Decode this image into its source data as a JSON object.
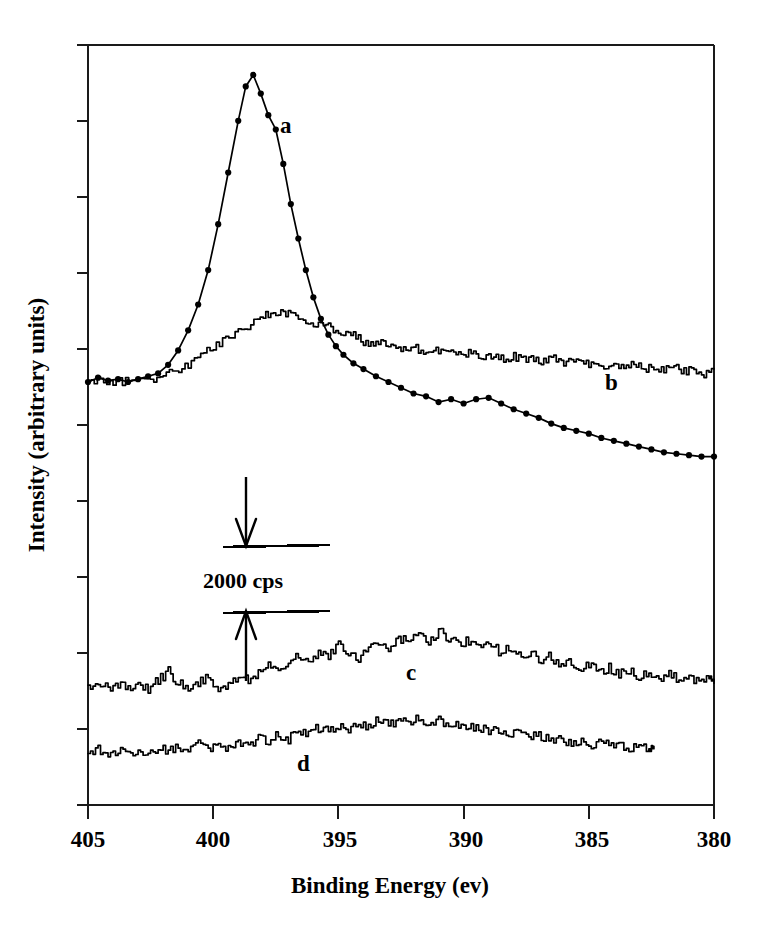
{
  "chart_data": {
    "type": "line",
    "title": "",
    "xlabel": "Binding Energy (ev)",
    "ylabel": "Intensity (arbitrary units)",
    "xlim": [
      405,
      380
    ],
    "x_axis_reversed": true,
    "xticks": [
      405,
      400,
      395,
      390,
      385,
      380
    ],
    "xticklabels": [
      "405",
      "400",
      "395",
      "390",
      "385",
      "380"
    ],
    "yticks_count": 11,
    "yticklabels": [],
    "grid": false,
    "legend": "inline-curve-labels",
    "annotations": [
      {
        "name": "intensity-scale-bar",
        "text": "2000 cps",
        "kind": "double-arrow-scale-bar",
        "x_binding_energy": 397.4,
        "span_cps": 2000
      }
    ],
    "series": [
      {
        "name": "a",
        "label": "a",
        "marker": "circle",
        "label_x": 397.1,
        "label_y_px": 125,
        "comment": "Sharp intense N 1s peak near 398.6 eV with discrete data markers",
        "points": [
          [
            405.0,
            0.0
          ],
          [
            404.6,
            0.3
          ],
          [
            404.2,
            0.1
          ],
          [
            403.8,
            0.2
          ],
          [
            403.4,
            0.0
          ],
          [
            403.0,
            0.2
          ],
          [
            402.6,
            0.4
          ],
          [
            402.2,
            0.6
          ],
          [
            401.8,
            1.2
          ],
          [
            401.4,
            2.2
          ],
          [
            401.0,
            3.6
          ],
          [
            400.6,
            5.4
          ],
          [
            400.2,
            7.8
          ],
          [
            399.8,
            11.0
          ],
          [
            399.4,
            14.6
          ],
          [
            399.0,
            18.2
          ],
          [
            398.7,
            20.6
          ],
          [
            398.4,
            21.4
          ],
          [
            398.1,
            20.1
          ],
          [
            397.8,
            18.6
          ],
          [
            397.5,
            17.6
          ],
          [
            397.2,
            15.2
          ],
          [
            396.9,
            12.4
          ],
          [
            396.6,
            10.0
          ],
          [
            396.3,
            7.8
          ],
          [
            396.0,
            5.9
          ],
          [
            395.7,
            4.4
          ],
          [
            395.4,
            3.3
          ],
          [
            395.1,
            2.5
          ],
          [
            394.8,
            1.9
          ],
          [
            394.4,
            1.3
          ],
          [
            394.0,
            0.9
          ],
          [
            393.5,
            0.4
          ],
          [
            393.0,
            0.0
          ],
          [
            392.5,
            -0.4
          ],
          [
            392.0,
            -0.8
          ],
          [
            391.5,
            -1.0
          ],
          [
            391.0,
            -1.4
          ],
          [
            390.5,
            -1.2
          ],
          [
            390.0,
            -1.5
          ],
          [
            389.5,
            -1.2
          ],
          [
            389.0,
            -1.1
          ],
          [
            388.5,
            -1.5
          ],
          [
            388.0,
            -1.9
          ],
          [
            387.5,
            -2.2
          ],
          [
            387.0,
            -2.5
          ],
          [
            386.5,
            -2.9
          ],
          [
            386.0,
            -3.2
          ],
          [
            385.5,
            -3.4
          ],
          [
            385.0,
            -3.6
          ],
          [
            384.5,
            -3.9
          ],
          [
            384.0,
            -4.1
          ],
          [
            383.5,
            -4.3
          ],
          [
            383.0,
            -4.5
          ],
          [
            382.5,
            -4.7
          ],
          [
            382.0,
            -4.9
          ],
          [
            381.5,
            -5.0
          ],
          [
            381.0,
            -5.1
          ],
          [
            380.5,
            -5.2
          ],
          [
            380.0,
            -5.2
          ]
        ]
      },
      {
        "name": "b",
        "label": "b",
        "marker": "none",
        "label_x": 384.1,
        "label_y_px": 382,
        "comment": "Broad weak N 1s feature near 397.5 eV on sloping noisy background",
        "points": [
          [
            405.0,
            0.0
          ],
          [
            404.5,
            0.2
          ],
          [
            404.0,
            -0.1
          ],
          [
            403.5,
            0.1
          ],
          [
            403.0,
            0.3
          ],
          [
            402.5,
            0.0
          ],
          [
            402.0,
            0.4
          ],
          [
            401.5,
            0.8
          ],
          [
            401.0,
            1.2
          ],
          [
            400.5,
            1.9
          ],
          [
            400.0,
            2.4
          ],
          [
            399.5,
            3.1
          ],
          [
            399.0,
            3.5
          ],
          [
            398.5,
            4.1
          ],
          [
            398.0,
            4.6
          ],
          [
            397.6,
            4.9
          ],
          [
            397.2,
            4.7
          ],
          [
            396.8,
            4.9
          ],
          [
            396.4,
            4.4
          ],
          [
            396.0,
            4.0
          ],
          [
            395.6,
            4.2
          ],
          [
            395.2,
            3.6
          ],
          [
            394.8,
            3.2
          ],
          [
            394.4,
            3.3
          ],
          [
            394.0,
            2.8
          ],
          [
            393.6,
            2.6
          ],
          [
            393.2,
            2.9
          ],
          [
            392.8,
            2.4
          ],
          [
            392.4,
            2.2
          ],
          [
            392.0,
            2.4
          ],
          [
            391.6,
            2.1
          ],
          [
            391.2,
            2.3
          ],
          [
            390.8,
            2.0
          ],
          [
            390.4,
            2.2
          ],
          [
            390.0,
            1.9
          ],
          [
            389.6,
            2.1
          ],
          [
            389.2,
            1.8
          ],
          [
            388.8,
            1.9
          ],
          [
            388.4,
            1.6
          ],
          [
            388.0,
            1.8
          ],
          [
            387.6,
            1.5
          ],
          [
            387.2,
            1.7
          ],
          [
            386.8,
            1.4
          ],
          [
            386.4,
            1.6
          ],
          [
            386.0,
            1.3
          ],
          [
            385.6,
            1.5
          ],
          [
            385.2,
            1.2
          ],
          [
            384.8,
            1.4
          ],
          [
            384.4,
            1.1
          ],
          [
            384.0,
            1.3
          ],
          [
            383.6,
            1.0
          ],
          [
            383.2,
            1.2
          ],
          [
            382.8,
            0.9
          ],
          [
            382.4,
            1.1
          ],
          [
            382.0,
            0.8
          ],
          [
            381.6,
            1.0
          ],
          [
            381.2,
            0.7
          ],
          [
            380.8,
            0.9
          ],
          [
            380.4,
            0.6
          ],
          [
            380.0,
            0.9
          ]
        ]
      },
      {
        "name": "c",
        "label": "c",
        "marker": "none",
        "label_x": 392.1,
        "label_y_px": 672,
        "comment": "Very weak broad feature near 396.5 eV, noisy",
        "points": [
          [
            405.0,
            0.0
          ],
          [
            404.6,
            0.3
          ],
          [
            404.2,
            -0.2
          ],
          [
            403.8,
            0.2
          ],
          [
            403.4,
            -0.3
          ],
          [
            403.0,
            0.1
          ],
          [
            402.6,
            -0.2
          ],
          [
            402.2,
            0.4
          ],
          [
            401.8,
            1.0
          ],
          [
            401.4,
            0.2
          ],
          [
            401.0,
            -0.3
          ],
          [
            400.6,
            0.2
          ],
          [
            400.2,
            0.6
          ],
          [
            399.8,
            -0.4
          ],
          [
            399.4,
            0.3
          ],
          [
            399.0,
            0.7
          ],
          [
            398.6,
            0.4
          ],
          [
            398.2,
            1.0
          ],
          [
            397.8,
            1.5
          ],
          [
            397.4,
            1.2
          ],
          [
            397.0,
            1.8
          ],
          [
            396.6,
            2.0
          ],
          [
            396.2,
            1.6
          ],
          [
            395.8,
            2.3
          ],
          [
            395.4,
            2.1
          ],
          [
            395.0,
            2.8
          ],
          [
            394.6,
            2.4
          ],
          [
            394.2,
            1.7
          ],
          [
            393.8,
            2.6
          ],
          [
            393.4,
            3.0
          ],
          [
            393.0,
            2.7
          ],
          [
            392.6,
            3.3
          ],
          [
            392.2,
            3.1
          ],
          [
            391.8,
            3.6
          ],
          [
            391.4,
            3.2
          ],
          [
            391.0,
            3.8
          ],
          [
            390.6,
            3.4
          ],
          [
            390.2,
            2.9
          ],
          [
            389.8,
            3.2
          ],
          [
            389.4,
            2.6
          ],
          [
            389.0,
            3.0
          ],
          [
            388.6,
            2.4
          ],
          [
            388.2,
            2.7
          ],
          [
            387.8,
            2.1
          ],
          [
            387.4,
            2.4
          ],
          [
            387.0,
            1.8
          ],
          [
            386.6,
            2.1
          ],
          [
            386.2,
            1.5
          ],
          [
            385.8,
            1.8
          ],
          [
            385.4,
            1.2
          ],
          [
            385.0,
            1.5
          ],
          [
            384.6,
            1.0
          ],
          [
            384.2,
            1.3
          ],
          [
            383.8,
            0.8
          ],
          [
            383.4,
            1.1
          ],
          [
            383.0,
            0.6
          ],
          [
            382.6,
            0.9
          ],
          [
            382.2,
            0.5
          ],
          [
            381.8,
            0.8
          ],
          [
            381.4,
            0.4
          ],
          [
            381.0,
            0.7
          ],
          [
            380.6,
            0.3
          ],
          [
            380.2,
            0.6
          ],
          [
            380.0,
            0.2
          ]
        ]
      },
      {
        "name": "d",
        "label": "d",
        "marker": "none",
        "label_x": 396.4,
        "label_y_px": 763,
        "comment": "Weakest broad feature near 396.5 eV, terminates before right edge",
        "points": [
          [
            405.0,
            0.0
          ],
          [
            404.6,
            0.2
          ],
          [
            404.2,
            -0.2
          ],
          [
            403.8,
            0.1
          ],
          [
            403.4,
            -0.2
          ],
          [
            403.0,
            0.2
          ],
          [
            402.6,
            -0.1
          ],
          [
            402.2,
            0.3
          ],
          [
            401.8,
            0.0
          ],
          [
            401.4,
            0.4
          ],
          [
            401.0,
            0.1
          ],
          [
            400.6,
            0.5
          ],
          [
            400.2,
            0.2
          ],
          [
            399.8,
            0.6
          ],
          [
            399.4,
            0.3
          ],
          [
            399.0,
            0.8
          ],
          [
            398.6,
            0.5
          ],
          [
            398.2,
            1.0
          ],
          [
            397.8,
            0.7
          ],
          [
            397.4,
            1.2
          ],
          [
            397.0,
            0.9
          ],
          [
            396.6,
            1.5
          ],
          [
            396.2,
            1.2
          ],
          [
            395.8,
            1.7
          ],
          [
            395.4,
            1.4
          ],
          [
            395.0,
            1.9
          ],
          [
            394.6,
            1.6
          ],
          [
            394.2,
            2.1
          ],
          [
            393.8,
            1.8
          ],
          [
            393.4,
            2.2
          ],
          [
            393.0,
            1.9
          ],
          [
            392.6,
            2.3
          ],
          [
            392.2,
            2.0
          ],
          [
            391.8,
            2.4
          ],
          [
            391.4,
            2.1
          ],
          [
            391.0,
            2.2
          ],
          [
            390.6,
            1.8
          ],
          [
            390.2,
            2.0
          ],
          [
            389.8,
            1.6
          ],
          [
            389.4,
            1.8
          ],
          [
            389.0,
            1.4
          ],
          [
            388.6,
            1.6
          ],
          [
            388.2,
            1.2
          ],
          [
            387.8,
            1.4
          ],
          [
            387.4,
            1.0
          ],
          [
            387.0,
            1.2
          ],
          [
            386.6,
            0.8
          ],
          [
            386.2,
            1.0
          ],
          [
            385.8,
            0.6
          ],
          [
            385.4,
            0.8
          ],
          [
            385.0,
            0.5
          ],
          [
            384.6,
            0.7
          ],
          [
            384.2,
            0.4
          ],
          [
            383.8,
            0.6
          ],
          [
            383.4,
            0.3
          ],
          [
            383.0,
            0.5
          ],
          [
            382.6,
            0.2
          ],
          [
            382.4,
            0.4
          ]
        ]
      }
    ]
  },
  "figure": {
    "xlabel": "Binding Energy (ev)",
    "ylabel": "Intensity (arbitrary units)",
    "scale_bar_text": "2000 cps",
    "curve_a_label": "a",
    "curve_b_label": "b",
    "curve_c_label": "c",
    "curve_d_label": "d",
    "tick_405": "405",
    "tick_400": "400",
    "tick_395": "395",
    "tick_390": "390",
    "tick_385": "385",
    "tick_380": "380"
  },
  "colors": {
    "background": "#ffffff",
    "ink": "#000000",
    "axis": "#1a1a1a"
  }
}
